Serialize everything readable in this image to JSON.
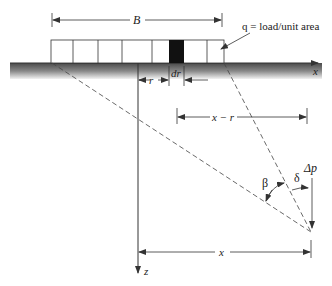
{
  "diagram": {
    "labels": {
      "width": "B",
      "load": "q = load/unit area",
      "x_axis": "x",
      "z_axis": "z",
      "r": "r",
      "dr": "dr",
      "x_minus_r": "x − r",
      "beta": "β",
      "delta": "δ",
      "delta_p": "Δp",
      "x_dim": "x"
    },
    "colors": {
      "line": "#333333",
      "ground_dark": "#555555",
      "ground_light": "#dddddd",
      "element": "#111111"
    }
  }
}
